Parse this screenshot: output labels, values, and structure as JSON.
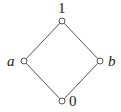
{
  "diagram": {
    "type": "hasse-diagram",
    "colors": {
      "edge": "#555555",
      "node_fill": "#ffffff",
      "label": "#222222"
    },
    "nodes": [
      {
        "id": "top",
        "label": "1",
        "italic": false,
        "x": 62,
        "y": 21,
        "lx": 58,
        "ly": 13
      },
      {
        "id": "left",
        "label": "a",
        "italic": true,
        "x": 24,
        "y": 61,
        "lx": 7,
        "ly": 66
      },
      {
        "id": "right",
        "label": "b",
        "italic": true,
        "x": 100,
        "y": 61,
        "lx": 108,
        "ly": 66
      },
      {
        "id": "bottom",
        "label": "0",
        "italic": false,
        "x": 62,
        "y": 101,
        "lx": 69,
        "ly": 106
      }
    ],
    "edges": [
      {
        "from": "top",
        "to": "left"
      },
      {
        "from": "top",
        "to": "right"
      },
      {
        "from": "left",
        "to": "bottom"
      },
      {
        "from": "right",
        "to": "bottom"
      }
    ]
  }
}
